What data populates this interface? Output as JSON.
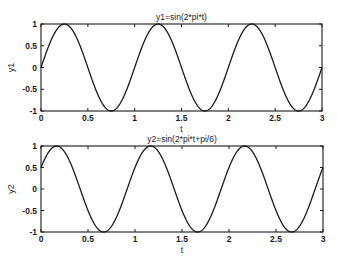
{
  "chart_data": [
    {
      "type": "line",
      "title": "y1=sin(2*pi*t)",
      "xlabel": "t",
      "ylabel": "y1",
      "xlim": [
        0,
        3
      ],
      "ylim": [
        -1,
        1
      ],
      "grid": false,
      "xticks": [
        0,
        0.5,
        1,
        1.5,
        2,
        2.5,
        3
      ],
      "xtick_labels": [
        "0",
        "0.5",
        "1",
        "1.5",
        "2",
        "2.5",
        "3"
      ],
      "yticks": [
        -1,
        -0.5,
        0,
        0.5,
        1
      ],
      "ytick_labels": [
        "-1",
        "-0.5",
        "0",
        "0.5",
        "1"
      ],
      "series": [
        {
          "name": "y1",
          "function": "sin(2*pi*t)",
          "phase": 0,
          "x": [
            0,
            0.25,
            0.5,
            0.75,
            1,
            1.25,
            1.5,
            1.75,
            2,
            2.25,
            2.5,
            2.75,
            3
          ],
          "values": [
            0,
            1,
            0,
            -1,
            0,
            1,
            0,
            -1,
            0,
            1,
            0,
            -1,
            0
          ]
        }
      ]
    },
    {
      "type": "line",
      "title": "y2=sin(2*pi*t+pi/6)",
      "xlabel": "t",
      "ylabel": "y2",
      "xlim": [
        0,
        3
      ],
      "ylim": [
        -1,
        1
      ],
      "grid": false,
      "xticks": [
        0,
        0.5,
        1,
        1.5,
        2,
        2.5,
        3
      ],
      "xtick_labels": [
        "0",
        "0.5",
        "1",
        "1.5",
        "2",
        "2.5",
        "3"
      ],
      "yticks": [
        -1,
        -0.5,
        0,
        0.5,
        1
      ],
      "ytick_labels": [
        "-1",
        "-0.5",
        "0",
        "0.5",
        "1"
      ],
      "series": [
        {
          "name": "y2",
          "function": "sin(2*pi*t+pi/6)",
          "phase": 0.5235987755982988,
          "x": [
            0,
            0.1667,
            0.4167,
            0.6667,
            0.9167,
            1.1667,
            1.4167,
            1.6667,
            1.9167,
            2.1667,
            2.4167,
            2.6667,
            2.9167,
            3
          ],
          "values": [
            0.5,
            1,
            0,
            -1,
            0,
            1,
            0,
            -1,
            0,
            1,
            0,
            -1,
            0,
            0.5
          ]
        }
      ]
    }
  ]
}
